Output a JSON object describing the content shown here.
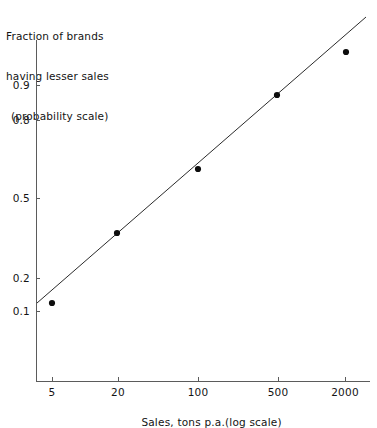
{
  "chart_data": {
    "type": "scatter",
    "title": "",
    "ylabel_lines": [
      "Fraction of brands",
      "having lesser sales",
      "(probability scale)"
    ],
    "xlabel": "Sales, tons p.a.(log scale)",
    "x_scale": "log",
    "y_scale": "probability",
    "grid": false,
    "legend": null,
    "x_ticks": [
      {
        "label": "5",
        "value": 5,
        "px": 52
      },
      {
        "label": "20",
        "value": 20,
        "px": 118
      },
      {
        "label": "100",
        "value": 100,
        "px": 198
      },
      {
        "label": "500",
        "value": 500,
        "px": 278
      },
      {
        "label": "2000",
        "value": 2000,
        "px": 345
      }
    ],
    "y_ticks": [
      {
        "label": "0.9",
        "value": 0.9,
        "px": 85
      },
      {
        "label": "0.8",
        "value": 0.8,
        "px": 120
      },
      {
        "label": "0.5",
        "value": 0.5,
        "px": 198
      },
      {
        "label": "0.2",
        "value": 0.2,
        "px": 278
      },
      {
        "label": "0.1",
        "value": 0.1,
        "px": 311
      }
    ],
    "points": [
      {
        "x": 5,
        "y": 0.14,
        "px": 52,
        "py": 303
      },
      {
        "x": 20,
        "y": 0.37,
        "px": 117,
        "py": 233
      },
      {
        "x": 100,
        "y": 0.61,
        "px": 198,
        "py": 169
      },
      {
        "x": 500,
        "y": 0.87,
        "px": 277,
        "py": 95
      },
      {
        "x": 2000,
        "y": 0.96,
        "px": 346,
        "py": 52
      }
    ],
    "fit_line": {
      "x1_px": 37,
      "y1_px": 303,
      "x2_px": 366,
      "y2_px": 17
    },
    "axes_px": {
      "y_spine_x": 36,
      "y_spine_top": 40,
      "y_spine_bottom": 381,
      "x_spine_y": 381,
      "x_spine_left": 36,
      "x_spine_right": 370
    },
    "colors": {
      "point": "#0d0d0d",
      "line": "#2b2b2b",
      "axis": "#5b5b5b",
      "text": "#141414",
      "background": "#ffffff"
    }
  }
}
